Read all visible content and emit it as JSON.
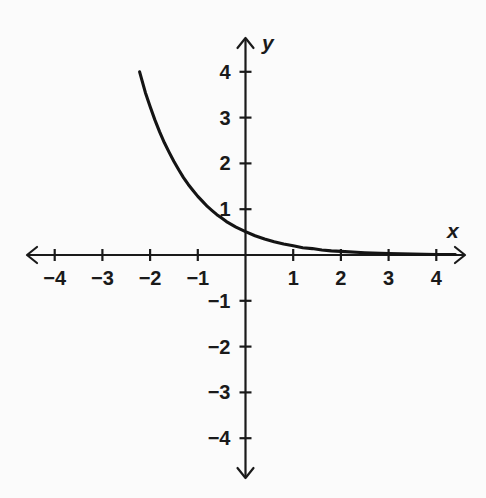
{
  "figure": {
    "background_color": "#fbfbfb",
    "ink_color": "#1a1a1a",
    "width": 486,
    "height": 498
  },
  "axes": {
    "x_axis_label": "x",
    "y_axis_label": "y",
    "origin_px": {
      "x": 245.5,
      "y": 255.0
    },
    "unit_px": {
      "x": 47.7,
      "y": 45.8
    },
    "x_arrow_left_px": 27,
    "x_arrow_right_px": 465,
    "y_arrow_top_px": 38,
    "y_arrow_bottom_px": 478,
    "tick_length_px": 12,
    "x_tick_labels": [
      "-4",
      "-3",
      "-2",
      "-1",
      "1",
      "2",
      "3",
      "4"
    ],
    "y_tick_labels": [
      "4",
      "3",
      "2",
      "1",
      "-1",
      "-2",
      "-3",
      "-4"
    ]
  },
  "chart_data": {
    "type": "line",
    "title": "",
    "subtitle": "",
    "xlabel": "x",
    "ylabel": "y",
    "xlim": [
      -4.6,
      4.6
    ],
    "ylim": [
      -4.8,
      4.8
    ],
    "grid": false,
    "legend": null,
    "legend_position": "none",
    "x_ticks": [
      -4,
      -3,
      -2,
      -1,
      1,
      2,
      3,
      4
    ],
    "y_ticks": [
      4,
      3,
      2,
      1,
      -1,
      -2,
      -3,
      -4
    ],
    "x_tick_labels": [
      "-4",
      "-3",
      "-2",
      "-1",
      "1",
      "2",
      "3",
      "4"
    ],
    "y_tick_labels": [
      "4",
      "3",
      "2",
      "1",
      "-1",
      "-2",
      "-3",
      "-4"
    ],
    "annotations": [],
    "series": [
      {
        "name": "decaying exponential",
        "function": "y = 0.30 * (4.45)^(-x)",
        "description": "Decreasing exponential curve: steeply descending from upper-left, flattening toward the positive x-axis as a horizontal asymptote at y = 0.",
        "asymptote": 0,
        "domain_drawn": [
          -2.22,
          4.4
        ],
        "stroke_color": "#141414",
        "x": [
          -2.22,
          -2.1,
          -2.0,
          -1.9,
          -1.8,
          -1.7,
          -1.6,
          -1.5,
          -1.4,
          -1.3,
          -1.2,
          -1.1,
          -1.0,
          -0.9,
          -0.8,
          -0.7,
          -0.6,
          -0.5,
          -0.4,
          -0.3,
          -0.2,
          -0.1,
          0.0,
          0.2,
          0.4,
          0.6,
          0.8,
          1.0,
          1.2,
          1.4,
          1.6,
          1.8,
          2.0,
          2.5,
          3.0,
          3.5,
          4.0,
          4.4
        ],
        "y": [
          4.0,
          3.55,
          3.24,
          2.95,
          2.69,
          2.45,
          2.24,
          2.04,
          1.86,
          1.69,
          1.54,
          1.41,
          1.28,
          1.17,
          1.06,
          0.97,
          0.88,
          0.81,
          0.73,
          0.67,
          0.61,
          0.56,
          0.51,
          0.42,
          0.35,
          0.29,
          0.24,
          0.2,
          0.16,
          0.14,
          0.11,
          0.09,
          0.08,
          0.05,
          0.03,
          0.02,
          0.01,
          0.01
        ]
      }
    ]
  }
}
